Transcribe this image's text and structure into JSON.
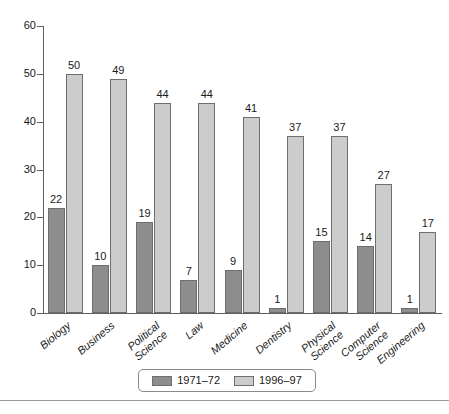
{
  "chart_data": {
    "type": "bar",
    "title": "",
    "subtitle": "",
    "xlabel": "",
    "ylabel": "",
    "ylim": [
      0,
      60
    ],
    "yticks": [
      0,
      10,
      20,
      30,
      40,
      50,
      60
    ],
    "grid": false,
    "legend_position": "bottom",
    "categories": [
      "Biology",
      "Business",
      "Political\nScience",
      "Law",
      "Medicine",
      "Dentistry",
      "Physical\nScience",
      "Computer\nScience",
      "Engineering"
    ],
    "series": [
      {
        "name": "1971–72",
        "color": "#8d8d8d",
        "values": [
          22,
          10,
          19,
          7,
          9,
          1,
          15,
          14,
          1
        ]
      },
      {
        "name": "1996–97",
        "color": "#cccccc",
        "values": [
          50,
          49,
          44,
          44,
          41,
          37,
          37,
          27,
          17
        ]
      }
    ]
  },
  "legend": {
    "entries": [
      {
        "label": "1971–72",
        "swatch": "#8d8d8d"
      },
      {
        "label": "1996–97",
        "swatch": "#cccccc"
      }
    ]
  },
  "axis": {
    "y_tick_labels": [
      "60",
      "50",
      "40",
      "30",
      "20",
      "10",
      "0"
    ]
  }
}
